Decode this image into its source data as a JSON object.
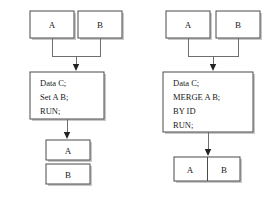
{
  "figure": {
    "background_color": "#ffffff",
    "stroke_color": "#4a4a4a",
    "connector_color": "#6e6e6e",
    "arrow_color": "#222222",
    "shadow_color": "#9a9a9a"
  },
  "left_flow": {
    "inputs": [
      {
        "label": "A"
      },
      {
        "label": "B"
      }
    ],
    "step": {
      "lines": [
        "Data C;",
        "Set A B;",
        "RUN;"
      ]
    },
    "outputs": [
      {
        "label": "A"
      },
      {
        "label": "B"
      }
    ]
  },
  "right_flow": {
    "inputs": [
      {
        "label": "A"
      },
      {
        "label": "B"
      }
    ],
    "step": {
      "lines": [
        "Data C;",
        "MERGE A B;",
        "BY ID",
        "RUN;"
      ]
    },
    "outputs": [
      {
        "label": "A"
      },
      {
        "label": "B"
      }
    ]
  }
}
